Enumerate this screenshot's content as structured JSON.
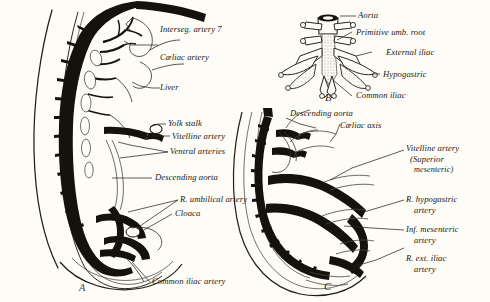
{
  "figure": {
    "background_color": "#fdfcf7",
    "ink_color": "#15120e",
    "description_note": "Three-panel line drawing of embryonic aorta and its branches"
  },
  "panel_letters": {
    "a": "A",
    "b": "B",
    "c": "C"
  },
  "panel_a": {
    "labels": {
      "interseg_artery": "Interseg. artery 7",
      "caeliac_artery": "Cæliac artery",
      "liver": "Liver",
      "yolk_stalk": "Yolk stalk",
      "vitelline_artery": "Vitelline artery",
      "ventral_arteries": "Ventral arteries",
      "descending_aorta": "Descending aorta",
      "r_umbilical_artery": "R. umbilical artery",
      "cloaca": "Cloaca",
      "common_iliac_artery": "Common iliac artery"
    }
  },
  "panel_b": {
    "labels": {
      "aorta": "Aorta",
      "primitive_umb_root": "Primitive umb. root",
      "external_iliac": "External iliac",
      "hypogastric": "Hypogastric",
      "common_iliac": "Common iliac"
    }
  },
  "panel_c": {
    "labels": {
      "descending_aorta": "Descending aorta",
      "caeliac_axis": "Cæliac axis",
      "vitelline_artery_line1": "Vitelline artery",
      "vitelline_artery_line2": "(Superior",
      "vitelline_artery_line3": "mesenteric)",
      "r_hypogastric_line1": "R. hypogastric",
      "r_hypogastric_line2": "artery",
      "inf_mesenteric_line1": "Inf. mesenteric",
      "inf_mesenteric_line2": "artery",
      "r_ext_iliac_line1": "R. ext. iliac",
      "r_ext_iliac_line2": "artery"
    }
  }
}
